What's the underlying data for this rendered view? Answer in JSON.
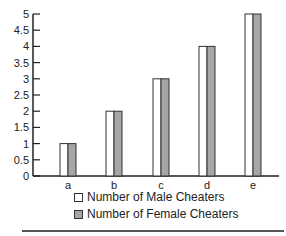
{
  "chart_data": {
    "type": "bar",
    "title": "",
    "xlabel": "",
    "ylabel": "",
    "categories": [
      "a",
      "b",
      "c",
      "d",
      "e"
    ],
    "series": [
      {
        "name": "Number of Male Cheaters",
        "values": [
          1,
          2,
          3,
          4,
          5
        ],
        "color": "#ffffff"
      },
      {
        "name": "Number of Female Cheaters",
        "values": [
          1,
          2,
          3,
          4,
          5
        ],
        "color": "#a6a6a6"
      }
    ],
    "ylim": [
      0,
      5
    ],
    "yticks": [
      "0",
      "0.5",
      "1",
      "1.5",
      "2",
      "2.5",
      "3",
      "3.5",
      "4",
      "4.5",
      "5"
    ],
    "grid": false,
    "legend_position": "bottom"
  },
  "legend": {
    "male_label": "Number of Male Cheaters",
    "female_label": "Number of Female Cheaters"
  }
}
